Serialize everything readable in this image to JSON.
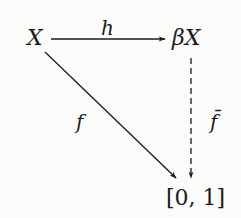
{
  "diagram": {
    "type": "commutative-diagram",
    "nodes": {
      "X": {
        "label": "X"
      },
      "betaX": {
        "label": "βX"
      },
      "interval": {
        "label": "[0, 1]"
      }
    },
    "edges": {
      "h": {
        "label": "h",
        "from": "X",
        "to": "βX",
        "style": "solid"
      },
      "f": {
        "label": "f",
        "from": "X",
        "to": "[0, 1]",
        "style": "solid"
      },
      "fbar": {
        "label": "f̄",
        "from": "βX",
        "to": "[0, 1]",
        "style": "dashed"
      }
    },
    "colors": {
      "ink": "#1a1a1a",
      "background": "#fbfbf9"
    }
  }
}
